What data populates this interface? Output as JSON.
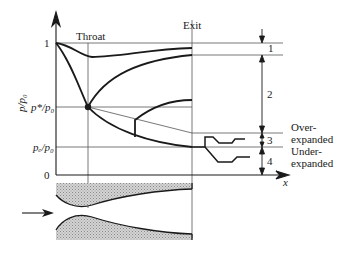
{
  "labels": {
    "throat": "Throat",
    "exit": "Exit",
    "y_axis": "p/p₀",
    "one": "1",
    "p_star": "p*/p₀",
    "p_e": "pₑ/p₀",
    "zero": "0",
    "x_axis": "x",
    "region_1": "1",
    "region_2": "2",
    "region_3": "3",
    "region_4": "4",
    "over_1": "Over-",
    "over_2": "expanded",
    "under_1": "Under-",
    "under_2": "expanded"
  },
  "colors": {
    "line": "#1a1a1a",
    "thin": "#555555",
    "hatch": "#b0b0b0"
  }
}
